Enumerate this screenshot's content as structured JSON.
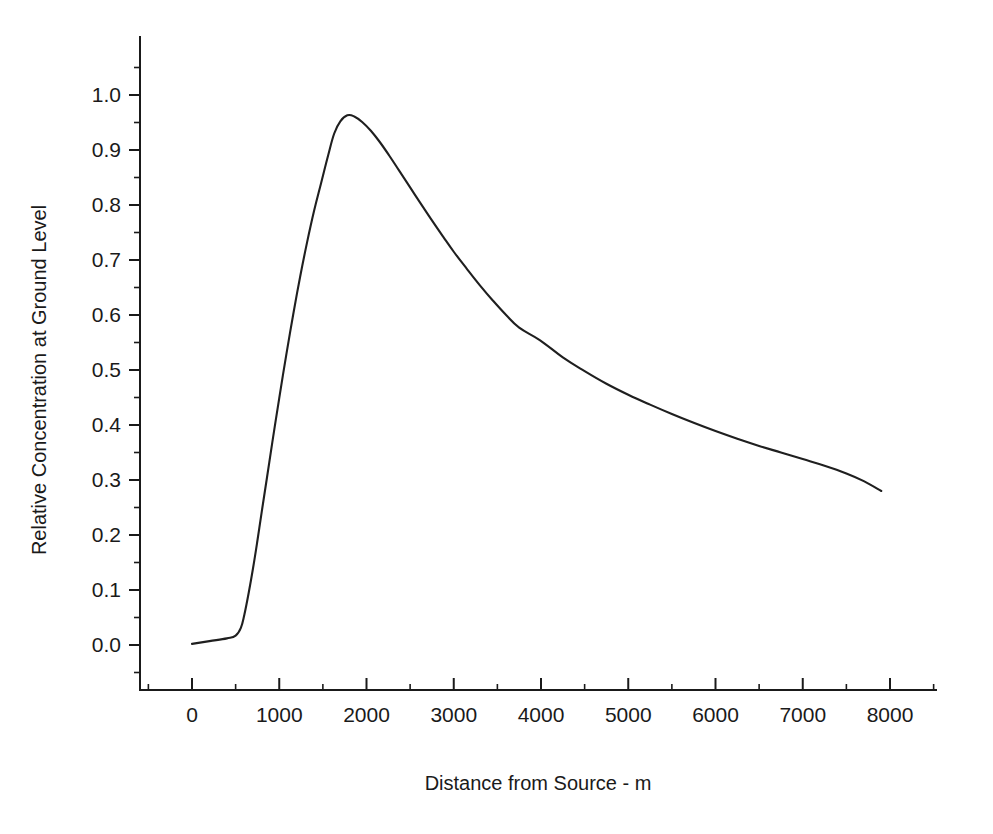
{
  "chart_data": {
    "type": "line",
    "title": "",
    "subtitle": "",
    "xlabel": "Distance from Source - m",
    "ylabel": "Relative Concentration at Ground Level",
    "xlim": [
      -500,
      8750
    ],
    "ylim": [
      -0.04,
      1.09
    ],
    "grid": false,
    "legend": null,
    "annotations": [],
    "x_ticks_major": [
      0,
      1000,
      2000,
      3000,
      4000,
      5000,
      6000,
      7000,
      8000
    ],
    "x_tick_labels": [
      "0",
      "1000",
      "2000",
      "3000",
      "4000",
      "5000",
      "6000",
      "7000",
      "8000"
    ],
    "x_ticks_minor": [
      -500,
      500,
      1500,
      2500,
      3500,
      4500,
      5500,
      6500,
      7500,
      8500
    ],
    "y_ticks_major": [
      0.0,
      0.1,
      0.2,
      0.3,
      0.4,
      0.5,
      0.6,
      0.7,
      0.8,
      0.9,
      1.0
    ],
    "y_tick_labels": [
      "0.0",
      "0.1",
      "0.2",
      "0.3",
      "0.4",
      "0.5",
      "0.6",
      "0.7",
      "0.8",
      "0.9",
      "1.0"
    ],
    "y_ticks_minor": [
      -0.05,
      0.05,
      0.15,
      0.25,
      0.35,
      0.45,
      0.55,
      0.65,
      0.75,
      0.85,
      0.95,
      1.05
    ],
    "series": [
      {
        "name": "Ground level relative concentration",
        "color": "#1f1f1f",
        "x": [
          0,
          200,
          400,
          500,
          560,
          600,
          650,
          700,
          750,
          800,
          860,
          920,
          1000,
          1080,
          1160,
          1240,
          1320,
          1400,
          1480,
          1560,
          1630,
          1700,
          1780,
          1860,
          1950,
          2050,
          2150,
          2260,
          2380,
          2500,
          2620,
          2750,
          2880,
          3000,
          3150,
          3300,
          3450,
          3600,
          3750,
          3990,
          4250,
          4500,
          4750,
          5000,
          5250,
          5500,
          5750,
          6000,
          6250,
          6500,
          6750,
          7000,
          7250,
          7500,
          7700,
          7900
        ],
        "y": [
          0.002,
          0.007,
          0.012,
          0.017,
          0.031,
          0.055,
          0.095,
          0.14,
          0.19,
          0.243,
          0.305,
          0.368,
          0.449,
          0.527,
          0.601,
          0.67,
          0.733,
          0.79,
          0.84,
          0.89,
          0.93,
          0.952,
          0.963,
          0.961,
          0.951,
          0.935,
          0.915,
          0.89,
          0.861,
          0.832,
          0.803,
          0.772,
          0.742,
          0.715,
          0.684,
          0.654,
          0.626,
          0.6,
          0.577,
          0.554,
          0.523,
          0.498,
          0.475,
          0.455,
          0.437,
          0.42,
          0.404,
          0.389,
          0.375,
          0.362,
          0.35,
          0.338,
          0.326,
          0.312,
          0.298,
          0.28
        ]
      }
    ],
    "peak": {
      "x": 1630,
      "y": 0.963
    },
    "endpoint": {
      "x": 7900,
      "y": 0.28
    }
  }
}
